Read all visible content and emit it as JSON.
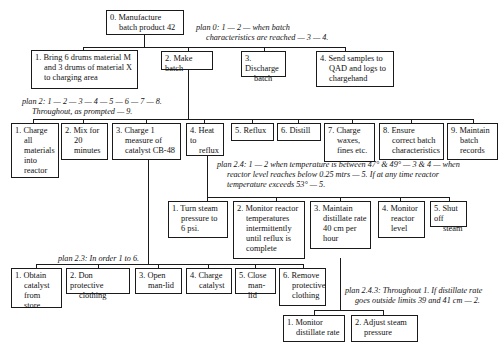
{
  "root": {
    "id": "0",
    "label": "0. Manufacture batch product 42",
    "lines": [
      "0. Manufacture",
      "batch product 42"
    ]
  },
  "plans": {
    "plan_0": {
      "lines": [
        "plan 0: 1 — 2 — when batch",
        "characteristics are reached — 3 — 4."
      ]
    },
    "plan_2": {
      "lines": [
        "plan 2: 1 — 2 — 3 — 4 — 5 — 6 — 7 — 8.",
        "Throughout, as prompted — 9."
      ]
    },
    "plan_2_3": {
      "lines": [
        "plan 2.3: In order 1 to 6."
      ]
    },
    "plan_2_4": {
      "lines": [
        "plan 2.4: 1 — 2 when temperature is between 47° & 49° — 3 & 4 — when",
        "reactor level reaches below 0.25 mtrs — 5. If at any time reactor",
        "temperature exceeds 53° — 5."
      ]
    },
    "plan_2_4_3": {
      "lines": [
        "plan 2.4.3: Throughout 1. If distillate rate",
        "goes outside limits 39 and 41 cm — 2."
      ]
    }
  },
  "level1": [
    {
      "id": "1",
      "lines": [
        "1. Bring 6 drums material M",
        "and 3 drums of material X",
        "to charging area"
      ]
    },
    {
      "id": "2",
      "lines": [
        "2. Make batch"
      ]
    },
    {
      "id": "3",
      "lines": [
        "3. Discharge",
        "batch"
      ]
    },
    {
      "id": "4",
      "lines": [
        "4. Send samples to",
        "QAD and logs to",
        "chargehand"
      ]
    }
  ],
  "level2": [
    {
      "id": "2.1",
      "lines": [
        "1. Charge",
        "all",
        "materials",
        "into",
        "reactor"
      ]
    },
    {
      "id": "2.2",
      "lines": [
        "2. Mix for",
        "20",
        "minutes"
      ]
    },
    {
      "id": "2.3",
      "lines": [
        "3. Charge 1",
        "measure of",
        "catalyst CB-48"
      ]
    },
    {
      "id": "2.4",
      "lines": [
        "4. Heat to",
        "reflux"
      ]
    },
    {
      "id": "2.5",
      "lines": [
        "5. Reflux"
      ]
    },
    {
      "id": "2.6",
      "lines": [
        "6. Distill"
      ]
    },
    {
      "id": "2.7",
      "lines": [
        "7. Charge",
        "waxes,",
        "fines etc."
      ]
    },
    {
      "id": "2.8",
      "lines": [
        "8. Ensure",
        "correct batch",
        "characteristics"
      ]
    },
    {
      "id": "2.9",
      "lines": [
        "9. Maintain",
        "batch",
        "records"
      ]
    }
  ],
  "level3_2_4": [
    {
      "id": "2.4.1",
      "lines": [
        "1. Turn steam",
        "pressure to",
        "6 psi."
      ]
    },
    {
      "id": "2.4.2",
      "lines": [
        "2. Monitor reactor",
        "temperatures",
        "intermittently",
        "until reflux is",
        "complete"
      ]
    },
    {
      "id": "2.4.3",
      "lines": [
        "3. Maintain",
        "distillate rate",
        "40 cm per",
        "hour"
      ]
    },
    {
      "id": "2.4.4",
      "lines": [
        "4. Monitor",
        "reactor",
        "level"
      ]
    },
    {
      "id": "2.4.5",
      "lines": [
        "5. Shut off",
        "steam"
      ]
    }
  ],
  "level3_2_3": [
    {
      "id": "2.3.1",
      "lines": [
        "1. Obtain",
        "catalyst",
        "from store"
      ]
    },
    {
      "id": "2.3.2",
      "lines": [
        "2. Don protective",
        "clothing"
      ]
    },
    {
      "id": "2.3.3",
      "lines": [
        "3. Open",
        "man-lid"
      ]
    },
    {
      "id": "2.3.4",
      "lines": [
        "4. Charge",
        "catalyst"
      ]
    },
    {
      "id": "2.3.5",
      "lines": [
        "5. Close",
        "man-lid"
      ]
    },
    {
      "id": "2.3.6",
      "lines": [
        "6. Remove",
        "protective",
        "clothing"
      ]
    }
  ],
  "level4_2_4_3": [
    {
      "id": "2.4.3.1",
      "lines": [
        "1. Monitor",
        "distillate rate"
      ]
    },
    {
      "id": "2.4.3.2",
      "lines": [
        "2. Adjust steam",
        "pressure"
      ]
    }
  ]
}
